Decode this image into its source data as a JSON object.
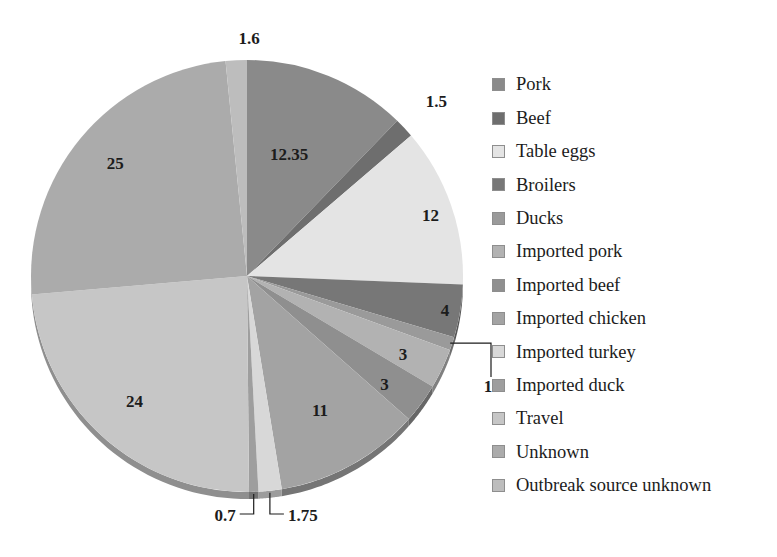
{
  "chart_data": {
    "type": "pie",
    "title": "",
    "subtitle": "",
    "xlabel": "",
    "ylabel": "",
    "grid": false,
    "legend_position": "right",
    "value_suffix": "",
    "categories": [
      "Pork",
      "Beef",
      "Table eggs",
      "Broilers",
      "Ducks",
      "Imported pork",
      "Imported beef",
      "Imported chicken",
      "Imported turkey",
      "Imported duck",
      "Travel",
      "Unknown",
      "Outbreak source unknown"
    ],
    "values": [
      12.35,
      1.5,
      12,
      4,
      1,
      3,
      3,
      11,
      1.75,
      0.7,
      24,
      25,
      1.6
    ],
    "labels": [
      "12.35",
      "1.5",
      "12",
      "4",
      "1",
      "3",
      "3",
      "11",
      "1.75",
      "0.7",
      "24",
      "25",
      "1.6"
    ],
    "colors": [
      "#8a8a8a",
      "#6e6e6e",
      "#e4e4e4",
      "#777777",
      "#9a9a9a",
      "#b2b2b2",
      "#8f8f8f",
      "#a3a3a3",
      "#d8d8d8",
      "#9e9e9e",
      "#c6c6c6",
      "#ababab",
      "#bdbdbd"
    ],
    "slices": [
      {
        "name": "Pork",
        "value": 12.35,
        "label": "12.35",
        "color": "#8a8a8a"
      },
      {
        "name": "Beef",
        "value": 1.5,
        "label": "1.5",
        "color": "#6e6e6e"
      },
      {
        "name": "Table eggs",
        "value": 12,
        "label": "12",
        "color": "#e4e4e4"
      },
      {
        "name": "Broilers",
        "value": 4,
        "label": "4",
        "color": "#777777"
      },
      {
        "name": "Ducks",
        "value": 1,
        "label": "1",
        "color": "#9a9a9a"
      },
      {
        "name": "Imported pork",
        "value": 3,
        "label": "3",
        "color": "#b2b2b2"
      },
      {
        "name": "Imported beef",
        "value": 3,
        "label": "3",
        "color": "#8f8f8f"
      },
      {
        "name": "Imported chicken",
        "value": 11,
        "label": "11",
        "color": "#a3a3a3"
      },
      {
        "name": "Imported turkey",
        "value": 1.75,
        "label": "1.75",
        "color": "#d8d8d8"
      },
      {
        "name": "Imported duck",
        "value": 0.7,
        "label": "0.7",
        "color": "#9e9e9e"
      },
      {
        "name": "Travel",
        "value": 24,
        "label": "24",
        "color": "#c6c6c6"
      },
      {
        "name": "Unknown",
        "value": 25,
        "label": "25",
        "color": "#ababab"
      },
      {
        "name": "Outbreak source unknown",
        "value": 1.6,
        "label": "1.6",
        "color": "#bdbdbd"
      }
    ],
    "total": 100.9
  },
  "legend": {
    "items": [
      {
        "label": "Pork",
        "color": "#8a8a8a"
      },
      {
        "label": "Beef",
        "color": "#6e6e6e"
      },
      {
        "label": "Table eggs",
        "color": "#e4e4e4"
      },
      {
        "label": "Broilers",
        "color": "#777777"
      },
      {
        "label": "Ducks",
        "color": "#9a9a9a"
      },
      {
        "label": "Imported pork",
        "color": "#b2b2b2"
      },
      {
        "label": "Imported beef",
        "color": "#8f8f8f"
      },
      {
        "label": "Imported chicken",
        "color": "#a3a3a3"
      },
      {
        "label": "Imported turkey",
        "color": "#d8d8d8"
      },
      {
        "label": "Imported duck",
        "color": "#9e9e9e"
      },
      {
        "label": "Travel",
        "color": "#c6c6c6"
      },
      {
        "label": "Unknown",
        "color": "#ababab"
      },
      {
        "label": "Outbreak source unknown",
        "color": "#bdbdbd"
      }
    ]
  },
  "geometry": {
    "cx": 247,
    "cy": 276,
    "r": 216,
    "depth": 7
  }
}
